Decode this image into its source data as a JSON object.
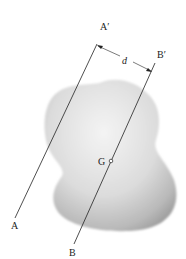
{
  "diagram": {
    "labels": {
      "axis_a_top": "A′",
      "axis_a_bottom": "A",
      "axis_b_top": "B′",
      "axis_b_bottom": "B",
      "distance": "d",
      "centroid": "G"
    },
    "colors": {
      "body_light": "#f2f2f2",
      "body_dark": "#9a9a9a",
      "line": "#222222"
    }
  }
}
